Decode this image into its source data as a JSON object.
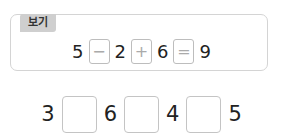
{
  "example": {
    "label": "보기",
    "equation": {
      "n1": "5",
      "op1": "−",
      "n2": "2",
      "op2": "+",
      "n3": "6",
      "op3": "=",
      "n4": "9"
    }
  },
  "problem": {
    "n1": "3",
    "blank1": "",
    "n2": "6",
    "blank2": "",
    "n3": "4",
    "blank3": "",
    "n4": "5"
  }
}
